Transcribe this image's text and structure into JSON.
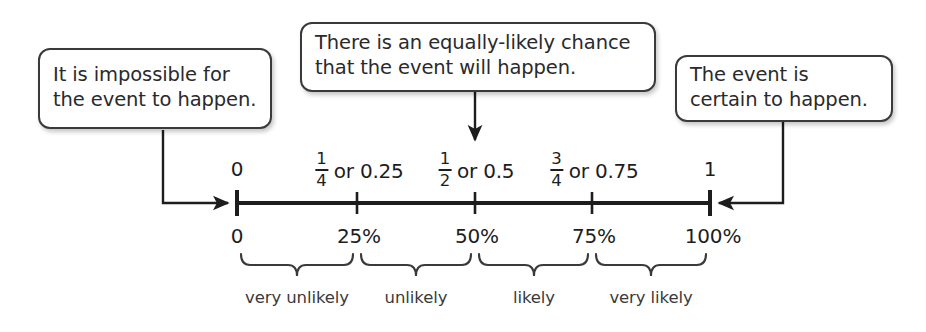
{
  "diagram": {
    "colors": {
      "ink": "#1d1d1d",
      "text": "#2a2a2a",
      "box_border": "#3a3a3a",
      "background": "#ffffff"
    }
  },
  "callouts": [
    {
      "id": "impossible",
      "line1": "It is impossible for",
      "line2": "the event to happen.",
      "points_to": "0"
    },
    {
      "id": "equally-likely",
      "line1": "There is an equally-likely chance",
      "line2": "that the event will happen.",
      "points_to": "0.5"
    },
    {
      "id": "certain",
      "line1": "The event is",
      "line2": "certain to happen.",
      "points_to": "1"
    }
  ],
  "number_line": {
    "ticks": [
      {
        "value": "0",
        "x": 237,
        "label_plain": "0",
        "numerator": "",
        "denominator": "",
        "or_text": ""
      },
      {
        "value": "0.25",
        "x": 357,
        "label_plain": "",
        "numerator": "1",
        "denominator": "4",
        "or_text": "or 0.25"
      },
      {
        "value": "0.5",
        "x": 475,
        "label_plain": "",
        "numerator": "1",
        "denominator": "2",
        "or_text": "or 0.5"
      },
      {
        "value": "0.75",
        "x": 592,
        "label_plain": "",
        "numerator": "3",
        "denominator": "4",
        "or_text": "or 0.75"
      },
      {
        "value": "1",
        "x": 710,
        "label_plain": "1",
        "numerator": "",
        "denominator": "",
        "or_text": ""
      }
    ],
    "percent_labels": [
      {
        "text": "0",
        "x": 237
      },
      {
        "text": "25%",
        "x": 357
      },
      {
        "text": "50%",
        "x": 475
      },
      {
        "text": "75%",
        "x": 592
      },
      {
        "text": "100%",
        "x": 710
      }
    ],
    "intervals": [
      {
        "label": "very unlikely",
        "from": "0",
        "to": "25%",
        "center_x": 297,
        "start_x": 241,
        "end_x": 353
      },
      {
        "label": "unlikely",
        "from": "25%",
        "to": "50%",
        "center_x": 416,
        "start_x": 361,
        "end_x": 471
      },
      {
        "label": "likely",
        "from": "50%",
        "to": "75%",
        "center_x": 534,
        "start_x": 479,
        "end_x": 588
      },
      {
        "label": "very likely",
        "from": "75%",
        "to": "100%",
        "center_x": 651,
        "start_x": 596,
        "end_x": 706
      }
    ]
  }
}
